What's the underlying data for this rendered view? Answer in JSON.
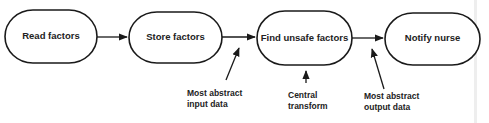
{
  "diagram": {
    "type": "data-flow",
    "colors": {
      "stroke": "#1a1a1a",
      "text": "#222222",
      "background": "#ffffff"
    },
    "nodes": [
      {
        "id": "read",
        "label": "Read factors"
      },
      {
        "id": "store",
        "label": "Store factors"
      },
      {
        "id": "find",
        "label": "Find unsafe factors"
      },
      {
        "id": "notify",
        "label": "Notify nurse"
      }
    ],
    "edges": [
      {
        "from": "read",
        "to": "store"
      },
      {
        "from": "store",
        "to": "find"
      },
      {
        "from": "find",
        "to": "notify"
      }
    ],
    "annotations": [
      {
        "id": "input",
        "lines": [
          "Most abstract",
          "input data"
        ],
        "points_to": "edge store→find"
      },
      {
        "id": "central",
        "lines": [
          "Central",
          "transform"
        ],
        "points_to": "node find"
      },
      {
        "id": "output",
        "lines": [
          "Most abstract",
          "output data"
        ],
        "points_to": "edge find→notify"
      }
    ]
  }
}
